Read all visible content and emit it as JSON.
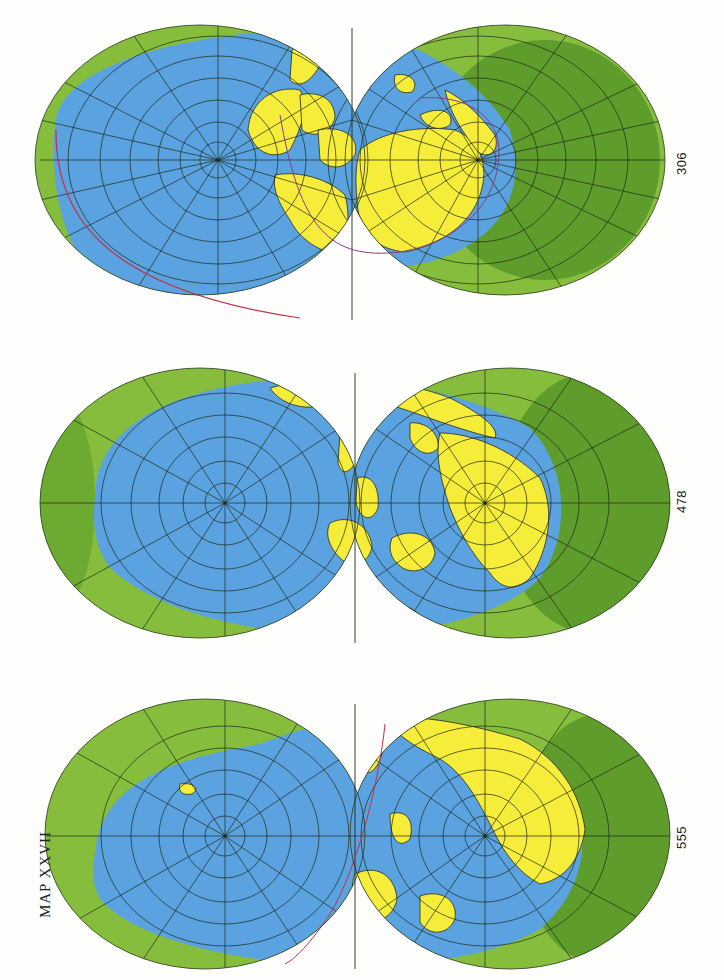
{
  "title": "MAP XXVII",
  "colors": {
    "ocean": "#5aa3e0",
    "land": "#f6ec3a",
    "backside_light": "#86bd3c",
    "backside_dark": "#5e9c2c",
    "graticule": "#1f2a1a",
    "coast": "#2a2a1a",
    "plate_boundary": "#c0304a",
    "boundary_purple": "#8a3a8a"
  },
  "maps": [
    {
      "id": "map-306",
      "label": "306",
      "top": 20,
      "label_y": 163
    },
    {
      "id": "map-478",
      "label": "478",
      "top": 338,
      "label_y": 502
    },
    {
      "id": "map-555",
      "label": "555",
      "top": 664,
      "label_y": 838
    }
  ]
}
